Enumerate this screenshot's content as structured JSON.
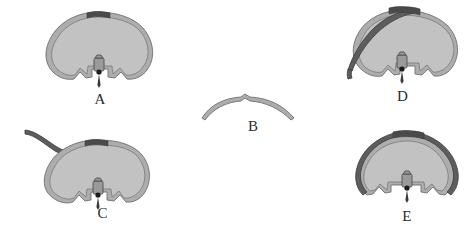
{
  "figure": {
    "width": 474,
    "height": 233,
    "background": "#ffffff",
    "caption_font": "serif"
  },
  "colors": {
    "wire_fill": "#adadad",
    "wire_fill_light": "#c4c4c4",
    "wire_outline": "#6f6f6f",
    "wire_dark": "#5d5d5d",
    "wire_dark_outline": "#3c3c3c",
    "apex_band": "#4a4a4a",
    "hub_body": "#9a9a9a",
    "hub_outline": "#4f4f4f",
    "hub_dot": "#1b1b1b",
    "needle": "#3a3a3a",
    "label_text": "#2b2b2b"
  },
  "panels": [
    {
      "id": "A",
      "label": "A",
      "name": "panel-a",
      "x": 30,
      "y": 6,
      "width": 140,
      "height": 110,
      "label_x": 0,
      "label_y": 86,
      "has_loop": true,
      "has_tail": false,
      "has_overlay_wire": false,
      "apex_band": true,
      "hub": true,
      "description": "Closed wire loop with central connector hub, dark band at apex"
    },
    {
      "id": "B",
      "label": "B",
      "name": "panel-b",
      "x": 198,
      "y": 92,
      "width": 110,
      "height": 46,
      "label_x": 0,
      "label_y": 27,
      "has_loop": false,
      "has_tail": false,
      "has_overlay_wire": false,
      "apex_band": false,
      "hub": false,
      "description": "Single shallow arched wire segment, no loop, no hub"
    },
    {
      "id": "C",
      "label": "C",
      "name": "panel-c",
      "x": 22,
      "y": 128,
      "width": 145,
      "height": 103,
      "label_x": 8,
      "label_y": 78,
      "has_loop": true,
      "has_tail": true,
      "has_overlay_wire": false,
      "apex_band": true,
      "hub": true,
      "description": "Wire loop with long free tail exiting upper left, connector hub at base"
    },
    {
      "id": "D",
      "label": "D",
      "name": "panel-d",
      "x": 340,
      "y": 6,
      "width": 125,
      "height": 106,
      "label_x": 0,
      "label_y": 83,
      "has_loop": true,
      "has_tail": true,
      "has_overlay_wire": true,
      "apex_band": true,
      "hub": true,
      "description": "Wire loop with dark wire threaded across and short tail at lower left"
    },
    {
      "id": "E",
      "label": "E",
      "name": "panel-e",
      "x": 348,
      "y": 130,
      "width": 118,
      "height": 103,
      "label_x": 0,
      "label_y": 79,
      "has_loop": true,
      "has_tail": false,
      "has_overlay_wire": true,
      "apex_band": true,
      "hub": true,
      "description": "Wire loop with second dark wire running fully alongside the loop"
    }
  ]
}
